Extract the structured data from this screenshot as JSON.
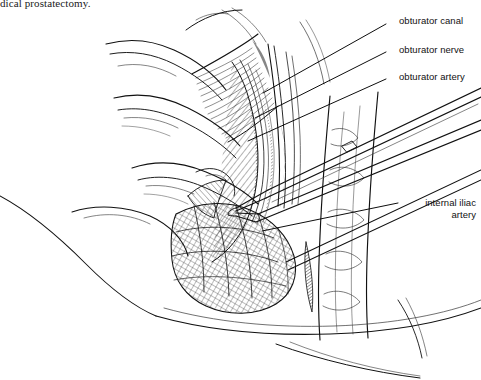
{
  "figure": {
    "type": "medical-line-illustration",
    "style": "black ink pen-and-ink hatching on white",
    "caption_text": "dical prostatectomy.",
    "ink_color": "#000000",
    "background_color": "#ffffff"
  },
  "labels": [
    {
      "id": "obturator-canal",
      "text": "obturator canal",
      "x": 399,
      "y": 15,
      "leader": {
        "x1": 386,
        "y1": 24,
        "x2": 263,
        "y2": 93
      }
    },
    {
      "id": "obturator-nerve",
      "text": "obturator nerve",
      "x": 399,
      "y": 44,
      "leader": {
        "x1": 386,
        "y1": 52,
        "x2": 255,
        "y2": 118
      }
    },
    {
      "id": "obturator-artery",
      "text": "obturator artery",
      "x": 399,
      "y": 71,
      "leader": {
        "x1": 386,
        "y1": 79,
        "x2": 248,
        "y2": 141
      }
    },
    {
      "id": "internal-iliac-artery",
      "text": "internal iliac artery",
      "line1": "internal iliac",
      "line2": "artery",
      "x": 404,
      "y": 197,
      "leader": {
        "x1": 398,
        "y1": 203,
        "x2": 262,
        "y2": 231
      }
    }
  ],
  "anatomy_regions": [
    {
      "id": "surgeon-fingers",
      "description": "gloved fingers retracting tissue from upper left"
    },
    {
      "id": "obturator-fossa",
      "description": "cross-hatched fatty nodal tissue in fossa"
    },
    {
      "id": "external-iliac-vessel",
      "description": "large vessel running vertically on the right"
    },
    {
      "id": "forceps-instrument",
      "description": "long surgical forceps entering from upper right"
    },
    {
      "id": "pelvic-sidewall",
      "description": "hatched muscular pelvic sidewall lower left"
    },
    {
      "id": "patient-contour",
      "description": "sweeping skin contour across lower portion"
    }
  ]
}
